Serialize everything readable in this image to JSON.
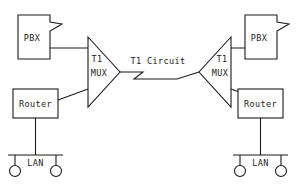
{
  "diagram": {
    "stroke_color": "#1a1a1a",
    "background_color": "#ffffff",
    "link_label": "T1 Circuit",
    "sites": [
      {
        "side": "left",
        "pbx_label": "PBX",
        "mux_label_line1": "T1",
        "mux_label_line2": "MUX",
        "router_label": "Router",
        "lan_label": "LAN",
        "host_count": 2
      },
      {
        "side": "right",
        "pbx_label": "PBX",
        "mux_label_line1": "T1",
        "mux_label_line2": "MUX",
        "router_label": "Router",
        "lan_label": "LAN",
        "host_count": 2
      }
    ]
  }
}
